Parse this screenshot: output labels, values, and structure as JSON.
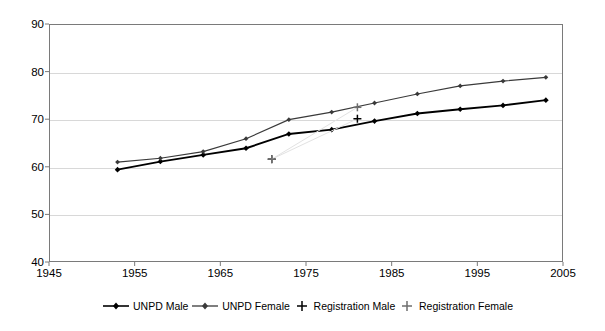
{
  "chart_data": {
    "type": "line",
    "title": "",
    "xlabel": "",
    "ylabel": "",
    "xlim": [
      1945,
      2005
    ],
    "ylim": [
      40,
      90
    ],
    "xticks": [
      1945,
      1955,
      1965,
      1975,
      1985,
      1995,
      2005
    ],
    "yticks": [
      40,
      50,
      60,
      70,
      80,
      90
    ],
    "grid": "horizontal",
    "legend_position": "bottom",
    "series": [
      {
        "name": "UNPD Male",
        "marker": "diamond",
        "color": "#000000",
        "x": [
          1953,
          1958,
          1963,
          1968,
          1973,
          1978,
          1983,
          1988,
          1993,
          1998,
          2003
        ],
        "values": [
          59.4,
          61.1,
          62.5,
          63.9,
          66.9,
          67.8,
          69.6,
          71.2,
          72.1,
          72.9,
          74.0
        ]
      },
      {
        "name": "UNPD Female",
        "marker": "diamond",
        "color": "#3a3a3a",
        "x": [
          1953,
          1958,
          1963,
          1968,
          1973,
          1978,
          1983,
          1988,
          1993,
          1998,
          2003
        ],
        "values": [
          61.0,
          61.8,
          63.2,
          65.9,
          69.9,
          71.5,
          73.4,
          75.3,
          77.0,
          78.0,
          78.8
        ]
      },
      {
        "name": "Registration Male",
        "marker": "plus",
        "color": "#000000",
        "x": [
          1971,
          1981
        ],
        "values": [
          61.6,
          70.1
        ]
      },
      {
        "name": "Registration Female",
        "marker": "plus",
        "color": "#6e6e6e",
        "x": [
          1971,
          1981
        ],
        "values": [
          61.6,
          72.5
        ]
      }
    ]
  },
  "legend": {
    "items": [
      {
        "label": "UNPD Male",
        "symbol": "line-diamond-marker"
      },
      {
        "label": "UNPD Female",
        "symbol": "line-diamond-marker"
      },
      {
        "label": "Registration Male",
        "symbol": "plus-marker"
      },
      {
        "label": "Registration Female",
        "symbol": "plus-marker"
      }
    ]
  },
  "axes": {
    "y_tick_labels": [
      "90",
      "80",
      "70",
      "60",
      "50",
      "40"
    ],
    "x_tick_labels": [
      "1945",
      "1955",
      "1965",
      "1975",
      "1985",
      "1995",
      "2005"
    ]
  }
}
